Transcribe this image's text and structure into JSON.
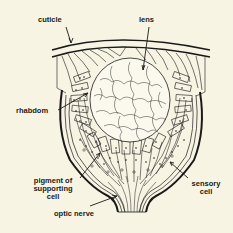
{
  "diagram": {
    "type": "anatomical cross-section",
    "colors": {
      "background": "#f7f4e3",
      "ink": "#1a1a1a"
    },
    "labels": {
      "cuticle": "cuticle",
      "lens": "lens",
      "rhabdom": "rhabdom",
      "pigment_line1": "pigment of",
      "pigment_line2": "supporting",
      "pigment_line3": "cell",
      "sensory_line1": "sensory",
      "sensory_line2": "cell",
      "optic_nerve": "optic nerve"
    }
  }
}
